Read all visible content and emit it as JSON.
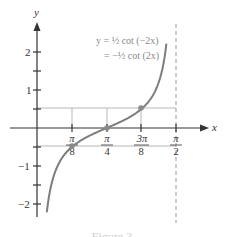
{
  "chart_data": {
    "type": "line",
    "title": "",
    "equation_line1": "y = ½ cot (−2x)",
    "equation_line2": "= −½ cot (2x)",
    "xlabel": "x",
    "ylabel": "y",
    "x_ticks": [
      {
        "value": 0.3927,
        "num": "π",
        "den": "8"
      },
      {
        "value": 0.7854,
        "num": "π",
        "den": "4"
      },
      {
        "value": 1.1781,
        "num": "3π",
        "den": "8"
      },
      {
        "value": 1.5708,
        "num": "π",
        "den": "2"
      }
    ],
    "y_ticks": [
      -2,
      -1.5,
      -1,
      -0.5,
      0.5,
      1,
      1.5,
      2
    ],
    "y_tick_labels": [
      {
        "value": 2,
        "label": "2"
      },
      {
        "value": 1,
        "label": "1"
      },
      {
        "value": -1,
        "label": "−1"
      },
      {
        "value": -2,
        "label": "−2"
      }
    ],
    "xlim": [
      0,
      1.5708
    ],
    "ylim": [
      -2.5,
      2.7
    ],
    "asymptote_x": 1.5708,
    "series": [
      {
        "name": "y = -1/2 cot(2x)",
        "x": [
          0.112,
          0.15,
          0.2,
          0.3,
          0.3927,
          0.5,
          0.6,
          0.7854,
          0.9,
          1.0,
          1.1781,
          1.3,
          1.4,
          1.459
        ],
        "y": [
          -2.21,
          -1.64,
          -1.19,
          -0.73,
          -0.5,
          -0.32,
          -0.18,
          0,
          0.16,
          0.32,
          0.5,
          0.85,
          1.44,
          2.21
        ]
      }
    ],
    "highlighted_points": [
      {
        "x": 0.3927,
        "y": -0.5
      },
      {
        "x": 0.7854,
        "y": 0
      },
      {
        "x": 1.1781,
        "y": 0.5
      }
    ],
    "guide_lines_y": [
      0.5,
      -0.5
    ],
    "caption": "Figure 3"
  },
  "caption_text": "Figure 3"
}
